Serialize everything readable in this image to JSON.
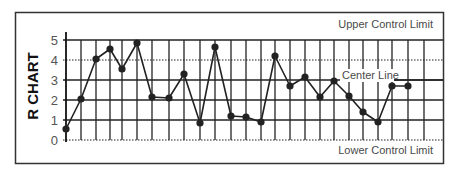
{
  "chart_data": {
    "type": "line",
    "title": "R CHART",
    "xlabel": "",
    "ylabel": "R CHART",
    "x": [
      1,
      2,
      3,
      4,
      5,
      6,
      7,
      8,
      9,
      10,
      11,
      12,
      13,
      14,
      15,
      16,
      17,
      18,
      19,
      20,
      21,
      22,
      23,
      24
    ],
    "series": [
      {
        "name": "Range",
        "values": [
          0.55,
          2.05,
          4.05,
          4.55,
          3.55,
          4.85,
          2.15,
          2.1,
          3.3,
          0.85,
          4.65,
          1.2,
          1.15,
          0.9,
          4.2,
          2.7,
          3.15,
          2.15,
          2.95,
          2.2,
          1.4,
          0.9,
          2.7,
          2.7
        ]
      }
    ],
    "ylim": [
      0,
      5
    ],
    "yticks": [
      0,
      1,
      2,
      3,
      4,
      5
    ],
    "grid": true,
    "annotations": [
      {
        "text": "Upper Control Limit",
        "y": 5
      },
      {
        "text": "Center Line",
        "y": 3
      },
      {
        "text": "Lower Control Limit",
        "y": 0
      }
    ],
    "legend": null
  },
  "labels": {
    "y_title": "R CHART",
    "upper_limit": "Upper Control Limit",
    "center_line": "Center Line",
    "lower_limit": "Lower Control Limit"
  },
  "colors": {
    "line": "#222222",
    "grid": "#222222",
    "border": "#333333",
    "text": "#4a4a4a"
  }
}
